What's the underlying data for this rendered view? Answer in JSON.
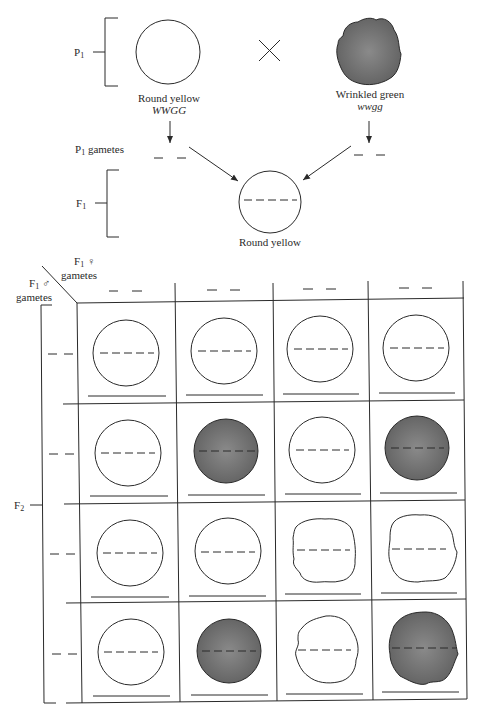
{
  "parental": {
    "generation_label": "P",
    "generation_sub": "1",
    "cross_symbol": "×",
    "left_parent": {
      "phenotype": "Round yellow",
      "genotype": "WWGG",
      "shape": "round",
      "color": "yellow"
    },
    "right_parent": {
      "phenotype": "Wrinkled green",
      "genotype": "wwgg",
      "shape": "wrinkled",
      "color": "green"
    },
    "gametes_label": "P",
    "gametes_sub": "1",
    "gametes_suffix": " gametes"
  },
  "f1": {
    "generation_label": "F",
    "generation_sub": "1",
    "phenotype": "Round yellow"
  },
  "punnett": {
    "female_label": "F",
    "female_sub": "1",
    "female_symbol": "♀",
    "female_gametes": "gametes",
    "male_label": "F",
    "male_sub": "1",
    "male_symbol": "♂",
    "male_gametes": "gametes",
    "f2_label": "F",
    "f2_sub": "2",
    "blank_gamete": "_ _",
    "columns": 4,
    "rows": [
      [
        {
          "shape": "round",
          "color": "yellow"
        },
        {
          "shape": "round",
          "color": "yellow"
        },
        {
          "shape": "round",
          "color": "yellow"
        },
        {
          "shape": "round",
          "color": "yellow"
        }
      ],
      [
        {
          "shape": "round",
          "color": "yellow"
        },
        {
          "shape": "round",
          "color": "green"
        },
        {
          "shape": "round",
          "color": "yellow"
        },
        {
          "shape": "round",
          "color": "green"
        }
      ],
      [
        {
          "shape": "round",
          "color": "yellow"
        },
        {
          "shape": "round",
          "color": "yellow"
        },
        {
          "shape": "wrinkled",
          "color": "yellow"
        },
        {
          "shape": "wrinkled",
          "color": "yellow"
        }
      ],
      [
        {
          "shape": "round",
          "color": "yellow"
        },
        {
          "shape": "round",
          "color": "green"
        },
        {
          "shape": "wrinkled",
          "color": "yellow"
        },
        {
          "shape": "wrinkled",
          "color": "green"
        }
      ]
    ]
  },
  "colors": {
    "line": "#2a2a2a",
    "green_fill": "#6f6f6f",
    "yellow_fill": "#ffffff"
  }
}
